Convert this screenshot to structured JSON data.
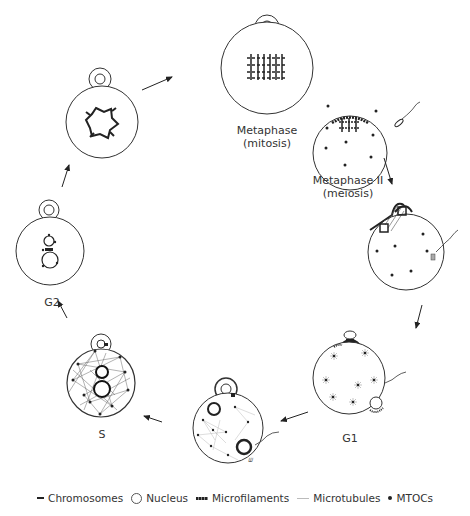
{
  "stages": [
    {
      "id": "metaphase-mitosis",
      "label": "Metaphase",
      "sublabel": "(mitosis)"
    },
    {
      "id": "metaphase-ii-meiosis",
      "label": "Metaphase II",
      "sublabel": "(meiosis)"
    },
    {
      "id": "fertilization",
      "label": "",
      "sublabel": ""
    },
    {
      "id": "g1",
      "label": "G1",
      "sublabel": ""
    },
    {
      "id": "pronuclei",
      "label": "",
      "sublabel": ""
    },
    {
      "id": "s",
      "label": "S",
      "sublabel": ""
    },
    {
      "id": "g2",
      "label": "G2",
      "sublabel": ""
    },
    {
      "id": "prophase",
      "label": "",
      "sublabel": ""
    }
  ],
  "legend": {
    "chromosomes": "Chromosomes",
    "nucleus": "Nucleus",
    "microfilaments": "Microfilaments",
    "microtubules": "Microtubules",
    "mtocs": "MTOCs"
  },
  "colors": {
    "ink": "#222222",
    "light_ink": "#999999",
    "background": "#ffffff"
  }
}
